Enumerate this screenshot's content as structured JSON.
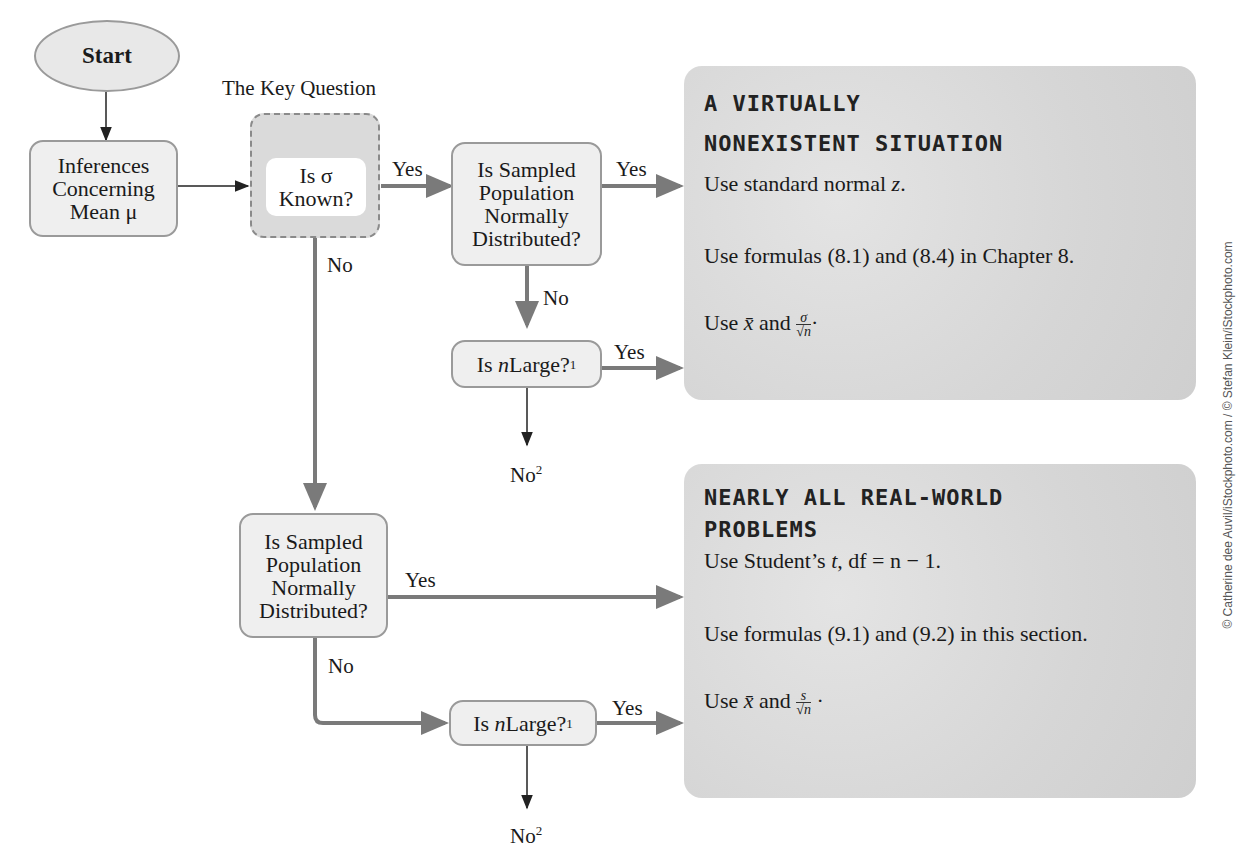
{
  "diagram": {
    "start": "Start",
    "key_question_caption": "The Key Question",
    "inferences": [
      "Inferences",
      "Concerning",
      "Mean μ"
    ],
    "sigma_known": [
      "Is σ",
      "Known?"
    ],
    "sampled_normal": [
      "Is Sampled",
      "Population",
      "Normally",
      "Distributed?"
    ],
    "n_large": {
      "prefix": "Is ",
      "var": "n",
      "suffix": " Large?",
      "footnote": "1"
    },
    "labels": {
      "yes": "Yes",
      "no": "No",
      "no2_base": "No",
      "no2_sup": "2"
    }
  },
  "panels": [
    {
      "title_lines": [
        "A VIRTUALLY",
        "NONEXISTENT SITUATION"
      ],
      "line1": {
        "text": "Use standard normal ",
        "var": "z",
        "end": "."
      },
      "line2": "Use formulas (8.1) and (8.4) in Chapter 8.",
      "line3": {
        "prefix": "Use ",
        "xbar": "x̄",
        "mid": " and ",
        "num": "σ",
        "den": "√n",
        "end": "·"
      }
    },
    {
      "title_lines": [
        "NEARLY ALL REAL-WORLD",
        "PROBLEMS"
      ],
      "line1": {
        "text": "Use Student’s ",
        "var": "t",
        "end": ", df = n − 1."
      },
      "line2": "Use formulas (9.1) and (9.2) in this section.",
      "line3": {
        "prefix": "Use ",
        "xbar": "x̄",
        "mid": " and ",
        "num": "s",
        "den": "√n",
        "end": " ·"
      }
    }
  ],
  "credit": "© Catherine dee Auvil/iStockphoto.com / © Stefan Klein/iStockphoto.com",
  "colors": {
    "box_fill": "#efefef",
    "box_border": "#9a9a9a",
    "panel_fill": "#d9d9d9",
    "arrow_thick": "#7a7a7a",
    "arrow_thin": "#222222"
  }
}
